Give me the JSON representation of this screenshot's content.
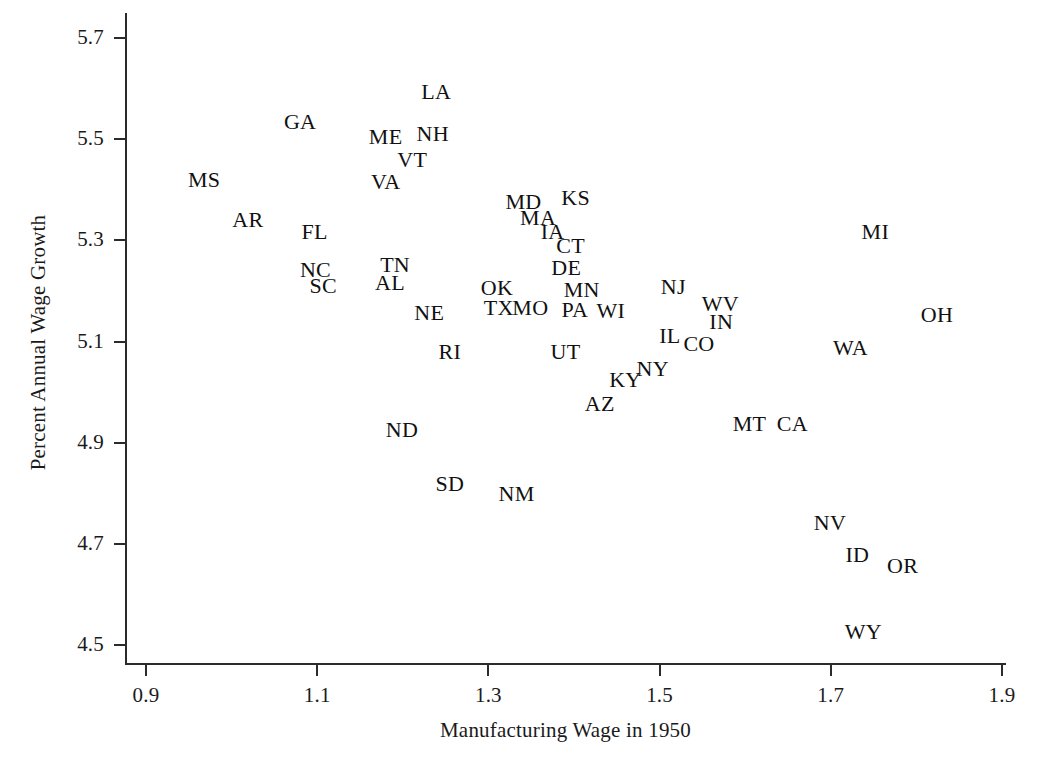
{
  "chart_data": {
    "type": "scatter",
    "title": "",
    "xlabel": "Manufacturing Wage in 1950",
    "ylabel": "Percent Annual Wage Growth",
    "xlim": [
      0.872,
      1.028
    ],
    "ylim": [
      4.462,
      5.749
    ],
    "xticks": [
      0.9,
      1.1,
      1.3,
      1.5,
      1.7,
      1.9
    ],
    "xtick_labels": [
      "0.9",
      "1.1",
      "1.3",
      "1.5",
      "1.7",
      "1.9"
    ],
    "yticks": [
      4.5,
      4.7,
      4.9,
      5.1,
      5.3,
      5.5,
      5.7
    ],
    "ytick_labels": [
      "4.5",
      "4.7",
      "4.9",
      "5.1",
      "5.3",
      "5.5",
      "5.7"
    ],
    "grid": false,
    "legend": false,
    "marker_style": "text-label",
    "point_count": 48,
    "points": [
      {
        "label": "GA",
        "x": 1.08,
        "y": 5.533
      },
      {
        "label": "MS",
        "x": 0.968,
        "y": 5.419
      },
      {
        "label": "AR",
        "x": 1.019,
        "y": 5.34
      },
      {
        "label": "FL",
        "x": 1.097,
        "y": 5.316
      },
      {
        "label": "NC",
        "x": 1.098,
        "y": 5.241
      },
      {
        "label": "SC",
        "x": 1.107,
        "y": 5.209
      },
      {
        "label": "LA",
        "x": 1.239,
        "y": 5.594
      },
      {
        "label": "ME",
        "x": 1.18,
        "y": 5.505
      },
      {
        "label": "NH",
        "x": 1.235,
        "y": 5.511
      },
      {
        "label": "VT",
        "x": 1.211,
        "y": 5.458
      },
      {
        "label": "VA",
        "x": 1.18,
        "y": 5.416
      },
      {
        "label": "TN",
        "x": 1.191,
        "y": 5.251
      },
      {
        "label": "AL",
        "x": 1.185,
        "y": 5.215
      },
      {
        "label": "MD",
        "x": 1.341,
        "y": 5.375
      },
      {
        "label": "KS",
        "x": 1.402,
        "y": 5.383
      },
      {
        "label": "MA",
        "x": 1.358,
        "y": 5.344
      },
      {
        "label": "IA",
        "x": 1.375,
        "y": 5.316
      },
      {
        "label": "CT",
        "x": 1.396,
        "y": 5.289
      },
      {
        "label": "DE",
        "x": 1.391,
        "y": 5.245
      },
      {
        "label": "MN",
        "x": 1.409,
        "y": 5.202
      },
      {
        "label": "NJ",
        "x": 1.516,
        "y": 5.207
      },
      {
        "label": "OK",
        "x": 1.31,
        "y": 5.206
      },
      {
        "label": "TX",
        "x": 1.312,
        "y": 5.166
      },
      {
        "label": "MO",
        "x": 1.349,
        "y": 5.166
      },
      {
        "label": "PA",
        "x": 1.401,
        "y": 5.162
      },
      {
        "label": "WI",
        "x": 1.443,
        "y": 5.16
      },
      {
        "label": "NE",
        "x": 1.231,
        "y": 5.156
      },
      {
        "label": "WV",
        "x": 1.571,
        "y": 5.174
      },
      {
        "label": "IN",
        "x": 1.572,
        "y": 5.139
      },
      {
        "label": "MI",
        "x": 1.752,
        "y": 5.317
      },
      {
        "label": "OH",
        "x": 1.824,
        "y": 5.153
      },
      {
        "label": "IL",
        "x": 1.512,
        "y": 5.111
      },
      {
        "label": "CO",
        "x": 1.546,
        "y": 5.095
      },
      {
        "label": "UT",
        "x": 1.39,
        "y": 5.079
      },
      {
        "label": "RI",
        "x": 1.255,
        "y": 5.079
      },
      {
        "label": "WA",
        "x": 1.723,
        "y": 5.088
      },
      {
        "label": "NY",
        "x": 1.492,
        "y": 5.046
      },
      {
        "label": "KY",
        "x": 1.46,
        "y": 5.024
      },
      {
        "label": "AZ",
        "x": 1.43,
        "y": 4.976
      },
      {
        "label": "MT",
        "x": 1.605,
        "y": 4.937
      },
      {
        "label": "CA",
        "x": 1.655,
        "y": 4.937
      },
      {
        "label": "ND",
        "x": 1.199,
        "y": 4.925
      },
      {
        "label": "SD",
        "x": 1.255,
        "y": 4.818
      },
      {
        "label": "NM",
        "x": 1.333,
        "y": 4.799
      },
      {
        "label": "NV",
        "x": 1.699,
        "y": 4.742
      },
      {
        "label": "ID",
        "x": 1.731,
        "y": 4.677
      },
      {
        "label": "OR",
        "x": 1.784,
        "y": 4.657
      },
      {
        "label": "WY",
        "x": 1.738,
        "y": 4.525
      }
    ]
  },
  "axes": {
    "x_title": "Manufacturing Wage in 1950",
    "y_title": "Percent Annual Wage Growth"
  },
  "style": {
    "background": "#ffffff",
    "axis_color": "#2b2b2b",
    "text_color": "#111111"
  }
}
